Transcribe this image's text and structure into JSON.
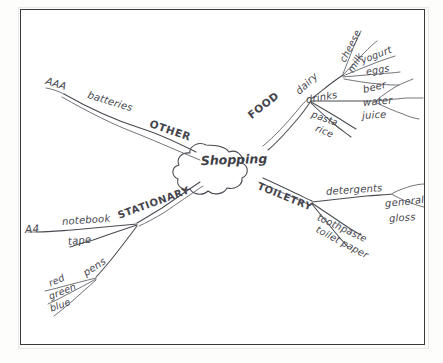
{
  "document": {
    "kind": "hand-drawn-mind-map",
    "center": {
      "label": "Shopping",
      "shape": "cloud"
    },
    "ink_color": "#4a4a52",
    "paper_color": "#ffffff",
    "border_color": "#3a3a3a"
  },
  "branches": [
    {
      "id": "food",
      "label": "FOOD",
      "direction": "upper-right",
      "children": [
        {
          "id": "dairy",
          "label": "dairy",
          "children": [
            {
              "id": "cheese",
              "label": "cheese"
            },
            {
              "id": "milk",
              "label": "milk"
            },
            {
              "id": "yogurt",
              "label": "yogurt"
            },
            {
              "id": "eggs",
              "label": "eggs"
            }
          ]
        },
        {
          "id": "drinks",
          "label": "drinks",
          "children": [
            {
              "id": "beer",
              "label": "beer"
            },
            {
              "id": "water",
              "label": "water"
            },
            {
              "id": "juice",
              "label": "juice"
            }
          ]
        },
        {
          "id": "pasta",
          "label": "pasta",
          "children": []
        },
        {
          "id": "rice",
          "label": "rice",
          "children": []
        }
      ]
    },
    {
      "id": "other",
      "label": "OTHER",
      "direction": "upper-left",
      "children": [
        {
          "id": "batteries",
          "label": "batteries",
          "children": [
            {
              "id": "aaa",
              "label": "AAA"
            }
          ]
        }
      ]
    },
    {
      "id": "stationary",
      "label": "STATIONARY",
      "direction": "lower-left",
      "children": [
        {
          "id": "notebook",
          "label": "notebook",
          "children": [
            {
              "id": "a4",
              "label": "A4"
            }
          ]
        },
        {
          "id": "tape",
          "label": "tape",
          "children": []
        },
        {
          "id": "pens",
          "label": "pens",
          "children": [
            {
              "id": "red",
              "label": "red"
            },
            {
              "id": "green",
              "label": "green"
            },
            {
              "id": "blue",
              "label": "blue"
            }
          ]
        }
      ]
    },
    {
      "id": "toiletry",
      "label": "TOILETRY",
      "direction": "lower-right",
      "children": [
        {
          "id": "detergents",
          "label": "detergents",
          "children": [
            {
              "id": "general",
              "label": "general"
            },
            {
              "id": "gloss",
              "label": "gloss"
            }
          ]
        },
        {
          "id": "toothpaste",
          "label": "toothpaste",
          "children": []
        },
        {
          "id": "toilet-paper",
          "label": "toilet paper",
          "children": []
        }
      ]
    }
  ]
}
